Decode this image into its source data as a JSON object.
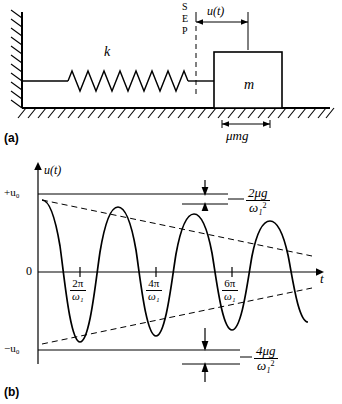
{
  "figure": {
    "panel_a": {
      "label": "(a)",
      "spring_label": "k",
      "mass_label": "m",
      "displacement_label": "u(t)",
      "friction_label": "μmg",
      "sep_letters": [
        "S",
        "E",
        "P"
      ]
    },
    "panel_b": {
      "label": "(b)",
      "y_axis_label": "u(t)",
      "x_axis_label": "t",
      "y_tick_top": "+u₀",
      "y_tick_bottom": "−u₀",
      "origin_label": "0",
      "x_ticks": [
        {
          "num": "2π",
          "den": "ω₁"
        },
        {
          "num": "4π",
          "den": "ω₁"
        },
        {
          "num": "6π",
          "den": "ω₁"
        }
      ],
      "annotation_top": {
        "num": "2μg",
        "den": "ω₁",
        "den_sup": "2"
      },
      "annotation_bottom": {
        "num": "4μg",
        "den": "ω₁",
        "den_sup": "2"
      }
    }
  },
  "colors": {
    "stroke": "#000000",
    "background": "#ffffff",
    "hatch": "#000000"
  }
}
